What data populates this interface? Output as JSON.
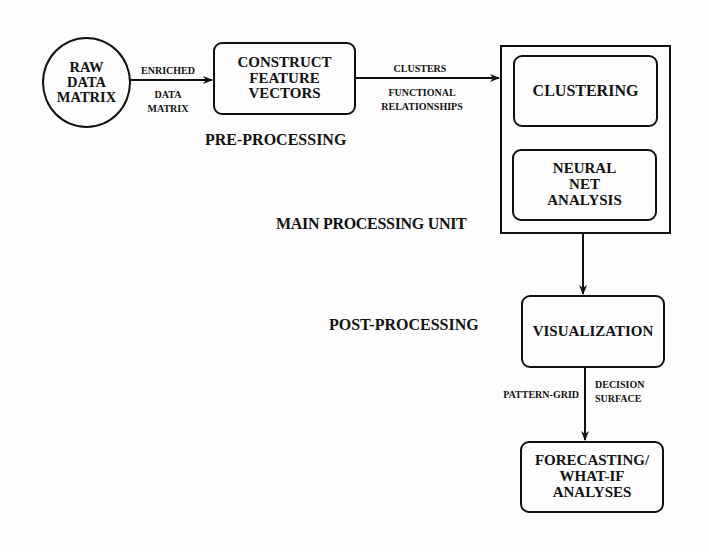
{
  "nodes": {
    "raw_data_matrix": {
      "lines": [
        "RAW",
        "DATA",
        "MATRIX"
      ],
      "shape": "circle"
    },
    "construct_feature_vectors": {
      "lines": [
        "CONSTRUCT",
        "FEATURE",
        "VECTORS"
      ],
      "shape": "rounded-rect"
    },
    "main_processing_unit": {
      "label": "MAIN PROCESSING UNIT",
      "children": {
        "clustering": {
          "lines": [
            "CLUSTERING"
          ]
        },
        "neural_net_analysis": {
          "lines": [
            "NEURAL",
            "NET",
            "ANALYSIS"
          ]
        }
      }
    },
    "visualization": {
      "lines": [
        "VISUALIZATION"
      ],
      "shape": "rounded-rect"
    },
    "forecasting": {
      "lines": [
        "FORECASTING/",
        "WHAT-IF",
        "ANALYSES"
      ],
      "shape": "rounded-rect"
    }
  },
  "edges": [
    {
      "from": "raw_data_matrix",
      "to": "construct_feature_vectors",
      "label_above": "ENRICHED",
      "label_below": [
        "DATA",
        "MATRIX"
      ]
    },
    {
      "from": "construct_feature_vectors",
      "to": "main_processing_unit",
      "label_above": "CLUSTERS",
      "label_below": [
        "FUNCTIONAL",
        "RELATIONSHIPS"
      ]
    },
    {
      "from": "main_processing_unit",
      "to": "visualization"
    },
    {
      "from": "visualization",
      "to": "forecasting",
      "label_left": "PATTERN-GRID",
      "label_right": [
        "DECISION",
        "SURFACE"
      ]
    }
  ],
  "stages": {
    "pre_processing": "PRE-PROCESSING",
    "main_processing": "MAIN PROCESSING UNIT",
    "post_processing": "POST-PROCESSING"
  },
  "colors": {
    "ink": "#111111",
    "paper": "#fdfdfd"
  }
}
